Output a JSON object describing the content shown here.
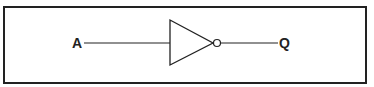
{
  "diagram": {
    "type": "logic-gate",
    "gate": "NOT (inverter)",
    "input_label": "A",
    "output_label": "Q",
    "colors": {
      "stroke": "#222222",
      "background": "#ffffff"
    }
  }
}
